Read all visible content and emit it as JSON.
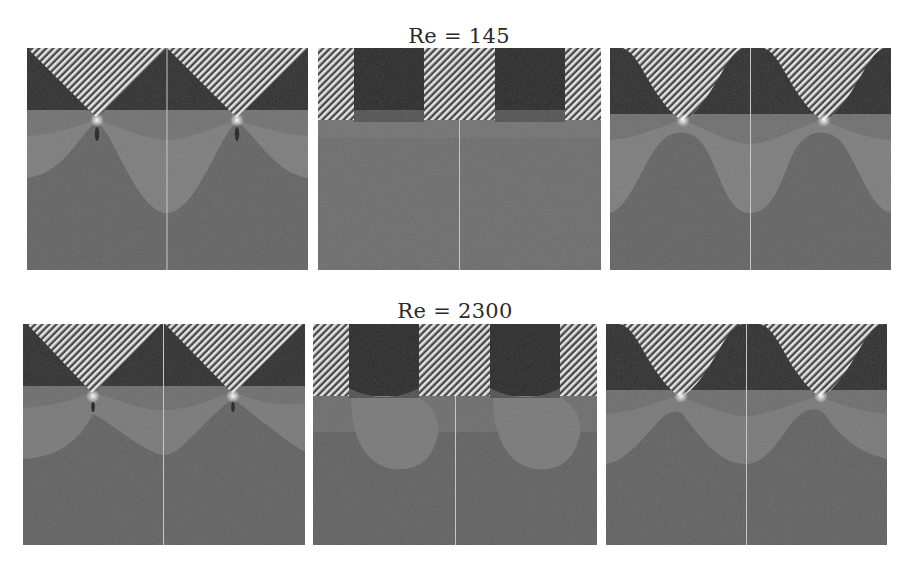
{
  "figure": {
    "rows": [
      {
        "title": "Re = 145",
        "panels": [
          {
            "id": "r1p1",
            "geometry": "triangular-roughness",
            "x": 27,
            "y": 48,
            "w": 281,
            "h": 222
          },
          {
            "id": "r1p2",
            "geometry": "square-roughness",
            "x": 318,
            "y": 48,
            "w": 283,
            "h": 222
          },
          {
            "id": "r1p3",
            "geometry": "sinusoidal-roughness",
            "x": 610,
            "y": 48,
            "w": 281,
            "h": 222
          }
        ]
      },
      {
        "title": "Re = 2300",
        "panels": [
          {
            "id": "r2p1",
            "geometry": "triangular-roughness",
            "x": 23,
            "y": 324,
            "w": 282,
            "h": 221
          },
          {
            "id": "r2p2",
            "geometry": "square-roughness",
            "x": 313,
            "y": 324,
            "w": 284,
            "h": 221
          },
          {
            "id": "r2p3",
            "geometry": "sinusoidal-roughness",
            "x": 606,
            "y": 324,
            "w": 281,
            "h": 221
          }
        ]
      }
    ],
    "colors": {
      "background": "#ffffff",
      "solid_hatch_light": "#e8e8e8",
      "solid_hatch_dark": "#3a3a3a",
      "cavity_dark": "#2b2b2b",
      "band_mid_dark": "#575757",
      "band_light": "#7a7a7a",
      "band_mid": "#686868",
      "bulk": "#626262",
      "divider": "#c8c8c8",
      "tip_glow": "#f5f5f5"
    }
  }
}
